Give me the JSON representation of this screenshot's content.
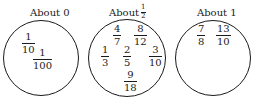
{
  "groups": [
    {
      "label": "About 0",
      "fractions": [
        {
          "num": "1",
          "den": "10"
        },
        {
          "num": "1",
          "den": "100"
        }
      ]
    },
    {
      "label": "About",
      "label_fraction": {
        "num": "1",
        "den": "2"
      },
      "fractions": [
        {
          "num": "4",
          "den": "7"
        },
        {
          "num": "8",
          "den": "12"
        },
        {
          "num": "1",
          "den": "3"
        },
        {
          "num": "2",
          "den": "5"
        },
        {
          "num": "3",
          "den": "10"
        },
        {
          "num": "9",
          "den": "18"
        }
      ]
    },
    {
      "label": "About 1",
      "fractions": [
        {
          "num": "7",
          "den": "8"
        },
        {
          "num": "13",
          "den": "10"
        }
      ]
    }
  ]
}
